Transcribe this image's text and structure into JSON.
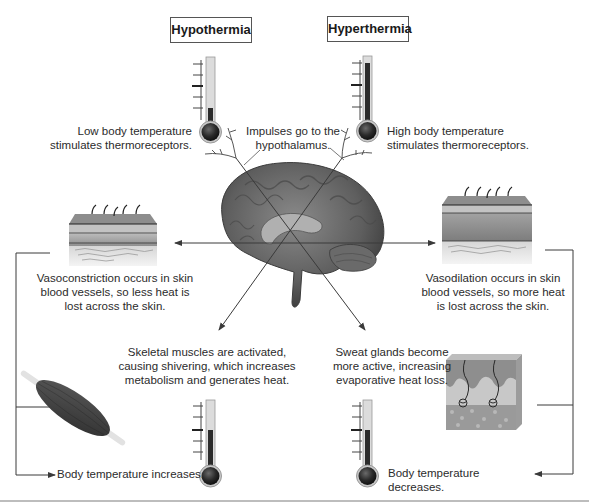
{
  "diagram": {
    "titles": {
      "hypothermia": "Hypothermia",
      "hyperthermia": "Hyperthermia"
    },
    "center": {
      "impulses_line1": "Impulses go to the",
      "impulses_line2": "hypothalamus.",
      "organ_icon": "brain-icon"
    },
    "hypothermia_path": {
      "stimulus_line1": "Low body temperature",
      "stimulus_line2": "stimulates thermoreceptors.",
      "skin_response_line1": "Vasoconstriction occurs in skin",
      "skin_response_line2": "blood vessels, so less heat is",
      "skin_response_line3": "lost across the skin.",
      "muscle_response_line1": "Skeletal muscles are activated,",
      "muscle_response_line2": "causing shivering, which increases",
      "muscle_response_line3": "metabolism and generates heat.",
      "outcome": "Body temperature increases.",
      "thermometer_start_level": "low",
      "thermometer_end_level": "normal"
    },
    "hyperthermia_path": {
      "stimulus_line1": "High body temperature",
      "stimulus_line2": "stimulates thermoreceptors.",
      "skin_response_line1": "Vasodilation occurs in skin",
      "skin_response_line2": "blood vessels, so more heat",
      "skin_response_line3": "is lost across the skin.",
      "sweat_response_line1": "Sweat glands become",
      "sweat_response_line2": "more active, increasing",
      "sweat_response_line3": "evaporative heat loss.",
      "outcome": "Body temperature decreases.",
      "thermometer_start_level": "high",
      "thermometer_end_level": "normal"
    },
    "colors": {
      "line": "#3a3a3a",
      "thermo_fill": "#2b2b2b",
      "thermo_tube": "#d9d9d9",
      "skin_top": "#8a8a8a",
      "brain": "#6f6f6f"
    }
  }
}
